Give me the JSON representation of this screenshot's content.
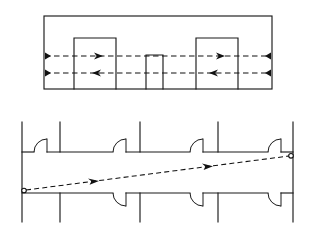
{
  "figure": {
    "panels": [
      {
        "id": "upper-panel",
        "name": "section-view",
        "description": "Rectangular duct section containing three internal baffle blocks with two horizontal dashed airflow paths"
      },
      {
        "id": "lower-panel",
        "name": "floor-plan-view",
        "description": "Corridor floor plan with five door openings on the upper wall and four on the lower wall, crossed by a diagonal dashed airflow path"
      }
    ],
    "colors": {
      "stroke": "#1a1a1a",
      "dash_stroke": "#111111",
      "background": "#ffffff",
      "marker_fill": "#ffffff"
    }
  },
  "upper_panel": {
    "outer_rect": {
      "x": 44,
      "y": 16,
      "width": 228,
      "height": 73
    },
    "blocks": [
      {
        "name": "baffle-block-left",
        "x": 74,
        "y": 38,
        "width": 42,
        "height": 51
      },
      {
        "name": "baffle-block-center",
        "x": 146,
        "y": 55,
        "width": 17,
        "height": 34
      },
      {
        "name": "baffle-block-right",
        "x": 196,
        "y": 38,
        "width": 42,
        "height": 51
      }
    ],
    "flow_lines": [
      {
        "name": "flow-line-upper",
        "y": 56,
        "x_start": 44,
        "x_end": 272,
        "direction": "rightward",
        "arrows": [
          {
            "x": 100,
            "y": 56,
            "direction": "right"
          },
          {
            "x": 222,
            "y": 56,
            "direction": "right"
          }
        ],
        "end_markers": [
          {
            "x": 45,
            "y": 56
          },
          {
            "x": 271,
            "y": 56
          }
        ]
      },
      {
        "name": "flow-line-lower",
        "y": 73,
        "x_start": 44,
        "x_end": 272,
        "direction": "leftward",
        "arrows": [
          {
            "x": 96,
            "y": 73,
            "direction": "left"
          },
          {
            "x": 213,
            "y": 73,
            "direction": "left"
          }
        ],
        "end_markers": [
          {
            "x": 45,
            "y": 73
          },
          {
            "x": 271,
            "y": 73
          }
        ]
      }
    ]
  },
  "lower_panel": {
    "upper_wall": {
      "y": 152,
      "x_start": 22,
      "x_end": 293
    },
    "lower_wall": {
      "y": 193,
      "x_start": 22,
      "x_end": 293
    },
    "left_wall": {
      "x": 22,
      "y_start": 122,
      "y_end": 222
    },
    "right_wall": {
      "x": 293,
      "y_start": 122,
      "y_end": 222
    },
    "upper_partitions": [
      {
        "name": "partition-upper-1",
        "x": 60,
        "y_start": 122,
        "y_end": 152
      },
      {
        "name": "partition-upper-2",
        "x": 140,
        "y_start": 122,
        "y_end": 152
      },
      {
        "name": "partition-upper-3",
        "x": 218,
        "y_start": 122,
        "y_end": 152
      }
    ],
    "lower_partitions": [
      {
        "name": "partition-lower-1",
        "x": 60,
        "y_start": 193,
        "y_end": 222
      },
      {
        "name": "partition-lower-2",
        "x": 140,
        "y_start": 193,
        "y_end": 222
      },
      {
        "name": "partition-lower-3",
        "x": 218,
        "y_start": 193,
        "y_end": 222
      }
    ],
    "upper_doors": [
      {
        "name": "door-upper-1",
        "hinge_x": 34,
        "jamb_x": 47,
        "wall_y": 152,
        "swing": "up"
      },
      {
        "name": "door-upper-2",
        "hinge_x": 113,
        "jamb_x": 126,
        "wall_y": 152,
        "swing": "up"
      },
      {
        "name": "door-upper-3",
        "hinge_x": 190,
        "jamb_x": 203,
        "wall_y": 152,
        "swing": "up"
      },
      {
        "name": "door-upper-4",
        "hinge_x": 268,
        "jamb_x": 281,
        "wall_y": 152,
        "swing": "up"
      }
    ],
    "lower_doors": [
      {
        "name": "door-lower-1",
        "hinge_x": 113,
        "jamb_x": 126,
        "wall_y": 193,
        "swing": "down"
      },
      {
        "name": "door-lower-2",
        "hinge_x": 190,
        "jamb_x": 203,
        "wall_y": 193,
        "swing": "down"
      },
      {
        "name": "door-lower-3",
        "hinge_x": 268,
        "jamb_x": 281,
        "wall_y": 193,
        "swing": "down"
      }
    ],
    "diagonal_flow": {
      "name": "diagonal-flow-line",
      "x_start": 24,
      "y_start": 190,
      "x_end": 291,
      "y_end": 156,
      "direction": "rightward-upward",
      "arrows": [
        {
          "x": 96,
          "y": 181,
          "direction": "right-up"
        },
        {
          "x": 210,
          "y": 166,
          "direction": "right-up"
        }
      ],
      "start_marker": {
        "x": 24,
        "y": 190
      },
      "end_marker": {
        "x": 291,
        "y": 156
      }
    }
  }
}
